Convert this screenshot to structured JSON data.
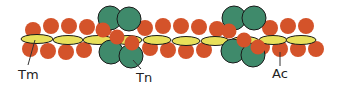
{
  "diagram": {
    "colors": {
      "actin": "#d4532a",
      "tropomyosin": "#e8e05a",
      "troponin": "#3f8a6b",
      "outline": "#1a1a1a",
      "leader": "#333333"
    },
    "labels": [
      {
        "id": "tm",
        "text": "Tm",
        "meaning": "Tropomyosin"
      },
      {
        "id": "tn",
        "text": "Tn",
        "meaning": "Troponin"
      },
      {
        "id": "ac",
        "text": "Ac",
        "meaning": "Actin"
      }
    ]
  }
}
